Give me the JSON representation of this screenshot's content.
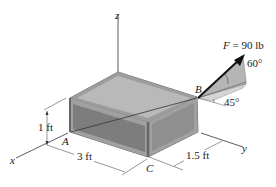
{
  "figure": {
    "axes": {
      "x": "x",
      "y": "y",
      "z": "z"
    },
    "points": {
      "A": "A",
      "B": "B",
      "C": "C"
    },
    "force": {
      "symbol": "F",
      "equals": " = 90 lb"
    },
    "angles": {
      "elevation": "60°",
      "azimuth": "45°"
    },
    "dimensions": {
      "height": "1 ft",
      "length": "3 ft",
      "depth": "1.5 ft"
    },
    "colors": {
      "frame": "#8a8a8a",
      "top_face": "#b9b9b9",
      "front_face": "#7d7d7d",
      "side_face": "#8f8f8f",
      "force_shade": "#a9a9a9",
      "line": "#333333"
    }
  }
}
